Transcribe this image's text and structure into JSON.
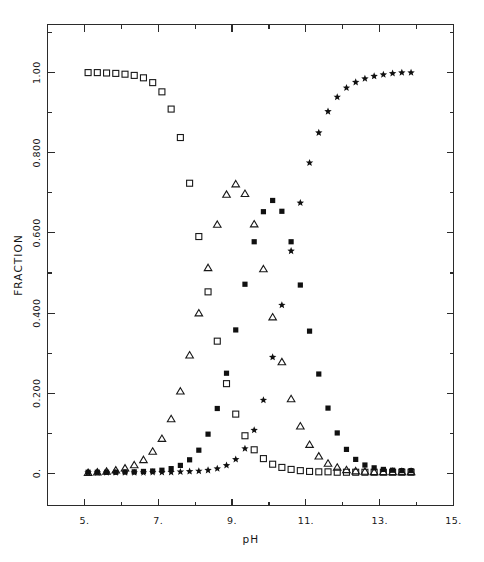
{
  "figure": {
    "background_color": "#ffffff",
    "ink_color": "#181818"
  },
  "chart_data": {
    "type": "scatter",
    "title": "",
    "xlabel": "pH",
    "ylabel": "FRACTION",
    "xlim": [
      4.0,
      15.0
    ],
    "ylim": [
      -0.08,
      1.12
    ],
    "grid": false,
    "legend_position": "none",
    "x_ticks_major": [
      "5.",
      "7.",
      "9.",
      "11.",
      "13.",
      "15."
    ],
    "x_ticks_major_values": [
      5,
      7,
      9,
      11,
      13,
      15
    ],
    "x_ticks_minor_values": [
      6,
      8,
      10,
      12,
      14
    ],
    "y_ticks_major": [
      "0.",
      "0.200",
      "0.400",
      "0.600",
      "0.800",
      "1.00"
    ],
    "y_ticks_major_values": [
      0.0,
      0.2,
      0.4,
      0.6,
      0.8,
      1.0
    ],
    "y_ticks_minor_values": [
      0.1,
      0.3,
      0.5,
      0.7,
      0.9,
      1.1
    ],
    "series": [
      {
        "name": "open-square",
        "marker": "open-square",
        "x": [
          5.1,
          5.35,
          5.6,
          5.85,
          6.1,
          6.35,
          6.6,
          6.85,
          7.1,
          7.35,
          7.6,
          7.85,
          8.1,
          8.35,
          8.6,
          8.85,
          9.1,
          9.35,
          9.6,
          9.85,
          10.1,
          10.35,
          10.6,
          10.85,
          11.1,
          11.35,
          11.6,
          11.85,
          12.1,
          12.35,
          12.6,
          12.85,
          13.1,
          13.35,
          13.6,
          13.85
        ],
        "y": [
          1.0,
          1.0,
          0.999,
          0.998,
          0.996,
          0.993,
          0.987,
          0.975,
          0.952,
          0.909,
          0.838,
          0.724,
          0.591,
          0.453,
          0.33,
          0.224,
          0.148,
          0.094,
          0.059,
          0.037,
          0.023,
          0.015,
          0.01,
          0.007,
          0.005,
          0.004,
          0.004,
          0.003,
          0.003,
          0.003,
          0.003,
          0.003,
          0.003,
          0.003,
          0.003,
          0.003
        ]
      },
      {
        "name": "open-triangle",
        "marker": "open-triangle",
        "x": [
          5.1,
          5.35,
          5.6,
          5.85,
          6.1,
          6.35,
          6.6,
          6.85,
          7.1,
          7.35,
          7.6,
          7.85,
          8.1,
          8.35,
          8.6,
          8.85,
          9.1,
          9.35,
          9.6,
          9.85,
          10.1,
          10.35,
          10.6,
          10.85,
          11.1,
          11.35,
          11.6,
          11.85,
          12.1,
          12.35,
          12.6,
          12.85,
          13.1,
          13.35,
          13.6,
          13.85
        ],
        "y": [
          0.002,
          0.003,
          0.005,
          0.008,
          0.013,
          0.021,
          0.034,
          0.055,
          0.087,
          0.136,
          0.205,
          0.295,
          0.4,
          0.513,
          0.621,
          0.696,
          0.722,
          0.698,
          0.622,
          0.51,
          0.39,
          0.278,
          0.186,
          0.118,
          0.072,
          0.043,
          0.025,
          0.015,
          0.009,
          0.006,
          0.005,
          0.004,
          0.004,
          0.004,
          0.004,
          0.004
        ]
      },
      {
        "name": "filled-square",
        "marker": "filled-square",
        "x": [
          5.1,
          5.35,
          5.6,
          5.85,
          6.1,
          6.35,
          6.6,
          6.85,
          7.1,
          7.35,
          7.6,
          7.85,
          8.1,
          8.35,
          8.6,
          8.85,
          9.1,
          9.35,
          9.6,
          9.85,
          10.1,
          10.35,
          10.6,
          10.85,
          11.1,
          11.35,
          11.6,
          11.85,
          12.1,
          12.35,
          12.6,
          12.85,
          13.1,
          13.35,
          13.6,
          13.85
        ],
        "y": [
          0.003,
          0.003,
          0.003,
          0.003,
          0.004,
          0.004,
          0.005,
          0.006,
          0.008,
          0.012,
          0.02,
          0.034,
          0.058,
          0.098,
          0.162,
          0.25,
          0.358,
          0.472,
          0.578,
          0.653,
          0.681,
          0.654,
          0.578,
          0.47,
          0.355,
          0.248,
          0.163,
          0.101,
          0.06,
          0.035,
          0.021,
          0.014,
          0.01,
          0.008,
          0.007,
          0.007
        ]
      },
      {
        "name": "star",
        "marker": "star",
        "x": [
          5.1,
          5.35,
          5.6,
          5.85,
          6.1,
          6.35,
          6.6,
          6.85,
          7.1,
          7.35,
          7.6,
          7.85,
          8.1,
          8.35,
          8.6,
          8.85,
          9.1,
          9.35,
          9.6,
          9.85,
          10.1,
          10.35,
          10.6,
          10.85,
          11.1,
          11.35,
          11.6,
          11.85,
          12.1,
          12.35,
          12.6,
          12.85,
          13.1,
          13.35,
          13.6,
          13.85
        ],
        "y": [
          0.002,
          0.002,
          0.002,
          0.002,
          0.002,
          0.002,
          0.002,
          0.003,
          0.003,
          0.003,
          0.004,
          0.005,
          0.006,
          0.008,
          0.012,
          0.02,
          0.035,
          0.062,
          0.108,
          0.183,
          0.29,
          0.42,
          0.555,
          0.675,
          0.775,
          0.85,
          0.903,
          0.939,
          0.962,
          0.976,
          0.985,
          0.991,
          0.995,
          0.998,
          1.0,
          1.0
        ]
      }
    ]
  }
}
